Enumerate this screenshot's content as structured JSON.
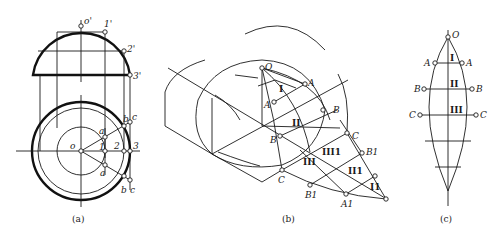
{
  "figure": {
    "panel_a": {
      "caption": "(a)",
      "front_view_labels": {
        "top": "o'",
        "p1": "1'",
        "p2": "2'",
        "p3": "3'"
      },
      "top_view_labels": {
        "center": "o",
        "p1": "1",
        "p2": "2",
        "p3": "3",
        "a_upper": "a",
        "a_lower": "a",
        "b_upper": "b",
        "b_lower": "b",
        "c_upper": "c",
        "c_lower": "c"
      }
    },
    "panel_b": {
      "caption": "(b)",
      "labels": {
        "O": "O",
        "A_inner": "A",
        "A_outer": "A",
        "B_inner": "B",
        "B_outer": "B",
        "C_inner": "C",
        "C_outer": "C",
        "B1_left": "B1",
        "B1_right": "B1",
        "A1": "A1",
        "I": "I",
        "II": "II",
        "III": "III",
        "III1": "III1",
        "II1": "II1",
        "I1": "I1"
      }
    },
    "panel_c": {
      "caption": "(c)",
      "labels": {
        "O": "O",
        "A_left": "A",
        "A_right": "A",
        "B_left": "B",
        "B_right": "B",
        "C_left": "C",
        "C_right": "C",
        "I": "I",
        "II": "II",
        "III": "III"
      }
    }
  }
}
